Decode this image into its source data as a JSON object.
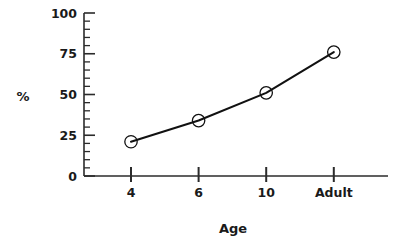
{
  "chart_data": {
    "type": "line",
    "title": "",
    "subtitle": "",
    "xlabel": "Age",
    "ylabel": "%",
    "categories": [
      "4",
      "6",
      "10",
      "Adult"
    ],
    "values": [
      21,
      34,
      51,
      76
    ],
    "series": [
      {
        "name": "percent",
        "values": [
          21,
          34,
          51,
          76
        ]
      }
    ],
    "ylim": [
      0,
      100
    ],
    "ytick_labels": [
      "0",
      "25",
      "50",
      "75",
      "100"
    ],
    "ytick_values": [
      0,
      25,
      50,
      75,
      100
    ],
    "yminor_step": 5,
    "xtick_labels": [
      "4",
      "6",
      "10",
      "Adult"
    ],
    "grid": false,
    "legend": false,
    "marker": "open-circle",
    "line_color": "#111111",
    "marker_edge_color": "#111111",
    "marker_face_color": "#ffffff",
    "axis_color": "#2b2b2b",
    "text_color": "#1a1a1a",
    "background_color": "#ffffff"
  },
  "axes": {
    "y_axis_name": "percent-axis",
    "x_axis_name": "age-axis"
  }
}
